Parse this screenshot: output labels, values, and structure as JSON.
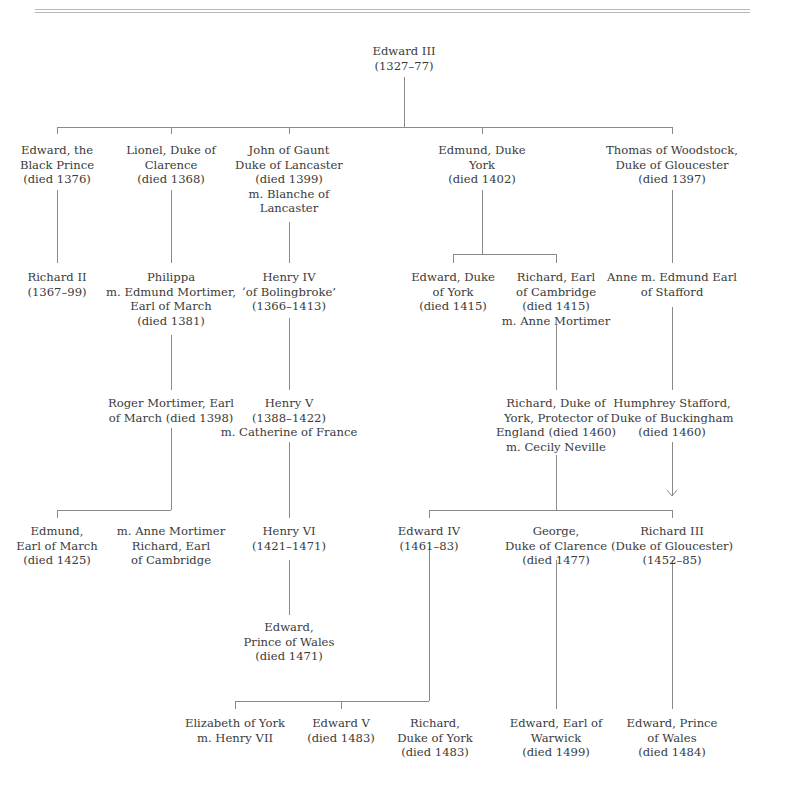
{
  "diagram": {
    "type": "family-tree",
    "nodes": {
      "edward3": {
        "lines": [
          "Edward III",
          "(1327–77)"
        ]
      },
      "black_prince": {
        "lines": [
          "Edward, the",
          "Black Prince",
          "(died 1376)"
        ]
      },
      "lionel": {
        "lines": [
          "Lionel, Duke of",
          "Clarence",
          "(died 1368)"
        ]
      },
      "gaunt": {
        "lines": [
          "John of Gaunt",
          "Duke of Lancaster",
          "(died 1399)",
          "m. Blanche of",
          "Lancaster"
        ]
      },
      "edmund_york": {
        "lines": [
          "Edmund, Duke",
          "York",
          "(died 1402)"
        ]
      },
      "thomas": {
        "lines": [
          "Thomas of Woodstock,",
          "Duke of Gloucester",
          "(died 1397)"
        ]
      },
      "richard2": {
        "lines": [
          "Richard II",
          "(1367–99)"
        ]
      },
      "philippa": {
        "lines": [
          "Philippa",
          "m. Edmund Mortimer,",
          "Earl of March",
          "(died 1381)"
        ]
      },
      "henry4": {
        "lines": [
          "Henry IV",
          "‘of Bolingbroke’",
          "(1366–1413)"
        ]
      },
      "edward_york": {
        "lines": [
          "Edward, Duke",
          "of York",
          "(died 1415)"
        ]
      },
      "richard_camb": {
        "lines": [
          "Richard, Earl",
          "of Cambridge",
          "(died 1415)",
          "m. Anne Mortimer"
        ]
      },
      "anne": {
        "lines": [
          "Anne m. Edmund Earl",
          "of Stafford"
        ]
      },
      "roger": {
        "lines": [
          "Roger Mortimer, Earl",
          "of March (died 1398)"
        ]
      },
      "henry5": {
        "lines": [
          "Henry V",
          "(1388–1422)",
          "m. Catherine of France"
        ]
      },
      "richard_york": {
        "lines": [
          "Richard, Duke of",
          "York, Protector of",
          "England (died 1460)",
          "m. Cecily Neville"
        ]
      },
      "humphrey": {
        "lines": [
          "Humphrey Stafford,",
          "Duke of Buckingham",
          "(died 1460)"
        ]
      },
      "edmund_march": {
        "lines": [
          "Edmund,",
          "Earl of March",
          "(died 1425)"
        ]
      },
      "anne_mortimer": {
        "lines": [
          "m. Anne Mortimer",
          "Richard, Earl",
          "of Cambridge"
        ]
      },
      "henry6": {
        "lines": [
          "Henry VI",
          "(1421–1471)"
        ]
      },
      "edward4": {
        "lines": [
          "Edward IV",
          "(1461–83)"
        ]
      },
      "george": {
        "lines": [
          "George,",
          "Duke of Clarence",
          "(died 1477)"
        ]
      },
      "richard3": {
        "lines": [
          "Richard III",
          "(Duke of Gloucester)",
          "(1452–85)"
        ]
      },
      "edward_pow1": {
        "lines": [
          "Edward,",
          "Prince of Wales",
          "(died 1471)"
        ]
      },
      "elizabeth": {
        "lines": [
          "Elizabeth of York",
          "m. Henry VII"
        ]
      },
      "edward5": {
        "lines": [
          "Edward V",
          "(died 1483)"
        ]
      },
      "richard_dy": {
        "lines": [
          "Richard,",
          "Duke of York",
          "(died 1483)"
        ]
      },
      "warwick": {
        "lines": [
          "Edward, Earl of",
          "Warwick",
          "(died 1499)"
        ]
      },
      "edward_pow2": {
        "lines": [
          "Edward, Prince",
          "of Wales",
          "(died 1484)"
        ]
      }
    }
  }
}
